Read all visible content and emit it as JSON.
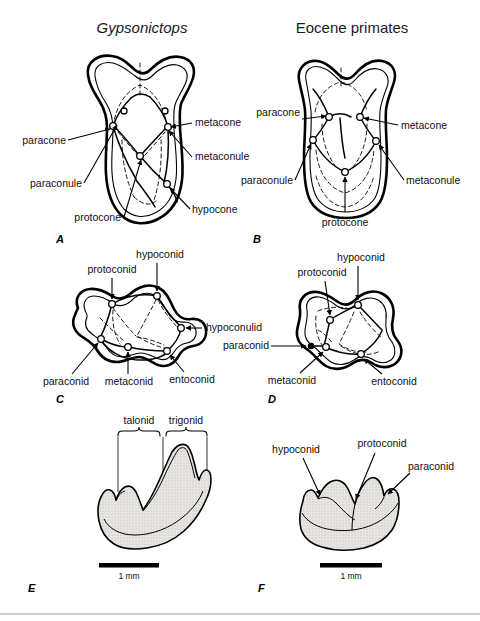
{
  "figure": {
    "width": 480,
    "height": 621,
    "background": "#ffffff",
    "ink": "#000000"
  },
  "titles": {
    "left": "Gypsonictops",
    "right": "Eocene primates"
  },
  "panels": {
    "a": {
      "letter": "A",
      "view": "upper molar occlusal",
      "labels": {
        "paracone": "paracone",
        "paraconule": "paraconule",
        "protocone": "protocone",
        "metacone": "metacone",
        "metaconule": "metaconule",
        "hypocone": "hypocone"
      }
    },
    "b": {
      "letter": "B",
      "view": "upper molar occlusal",
      "labels": {
        "paracone": "paracone",
        "paraconule": "paraconule",
        "protocone": "protocone",
        "metacone": "metacone",
        "metaconule": "metaconule"
      }
    },
    "c": {
      "letter": "C",
      "view": "lower molar occlusal",
      "labels": {
        "protoconid": "protoconid",
        "hypoconid": "hypoconid",
        "hypoconulid": "hypoconulid",
        "paraconid": "paraconid",
        "metaconid": "metaconid",
        "entoconid": "entoconid"
      }
    },
    "d": {
      "letter": "D",
      "view": "lower molar occlusal",
      "labels": {
        "protoconid": "protoconid",
        "hypoconid": "hypoconid",
        "paraconid": "paraconid",
        "metaconid": "metaconid",
        "entoconid": "entoconid"
      }
    },
    "e": {
      "letter": "E",
      "view": "lower molar lateral",
      "brackets": {
        "talonid": "talonid",
        "trigonid": "trigonid"
      },
      "scale": "1 mm"
    },
    "f": {
      "letter": "F",
      "view": "lower molar lateral",
      "labels": {
        "hypoconid": "hypoconid",
        "protoconid": "protoconid",
        "paraconid": "paraconid"
      },
      "scale": "1 mm"
    }
  }
}
